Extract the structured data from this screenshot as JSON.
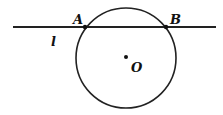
{
  "diagram": {
    "line": {
      "label": "l",
      "x1": 13,
      "y1": 27,
      "x2": 216,
      "y2": 27
    },
    "circle": {
      "center_label": "O",
      "cx": 126,
      "cy": 58,
      "r": 50
    },
    "points": [
      {
        "label": "A",
        "x": 85,
        "y": 27
      },
      {
        "label": "B",
        "x": 166,
        "y": 27
      }
    ],
    "colors": {
      "stroke": "#222222",
      "background": "#ffffff"
    }
  }
}
